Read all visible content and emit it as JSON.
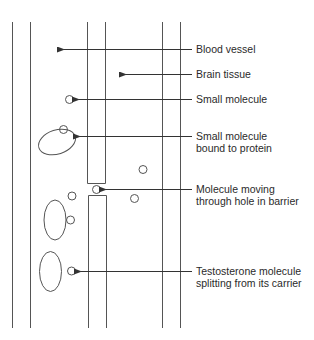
{
  "diagram": {
    "type": "blood-brain barrier schematic",
    "labels": [
      {
        "id": "blood-vessel",
        "lines": [
          "Blood vessel"
        ],
        "y": 43
      },
      {
        "id": "brain-tissue",
        "lines": [
          "Brain tissue"
        ],
        "y": 68
      },
      {
        "id": "small-molecule",
        "lines": [
          "Small molecule"
        ],
        "y": 93
      },
      {
        "id": "small-molecule-bound",
        "lines": [
          "Small molecule",
          "bound to protein"
        ],
        "y": 130
      },
      {
        "id": "molecule-moving",
        "lines": [
          "Molecule moving",
          "through hole in barrier"
        ],
        "y": 183
      },
      {
        "id": "testosterone",
        "lines": [
          "Testosterone molecule",
          "splitting from its carrier"
        ],
        "y": 265
      }
    ],
    "colors": {
      "line": "#4a4a4a",
      "text": "#2a2a2a",
      "background": "#ffffff"
    }
  }
}
